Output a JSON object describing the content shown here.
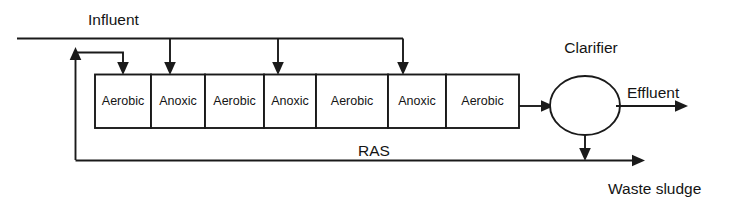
{
  "diagram": {
    "line_color": "#1a1a1a",
    "text_color": "#141414",
    "background_color": "#ffffff",
    "labels": {
      "influent": "Influent",
      "clarifier": "Clarifier",
      "effluent": "Effluent",
      "ras": "RAS",
      "waste_sludge": "Waste sludge"
    },
    "reactor_cells": [
      {
        "label": "Aerobic"
      },
      {
        "label": "Anoxic"
      },
      {
        "label": "Aerobic"
      },
      {
        "label": "Anoxic"
      },
      {
        "label": "Aerobic"
      },
      {
        "label": "Anoxic"
      },
      {
        "label": "Aerobic"
      }
    ],
    "influent_feed_points": 3,
    "recycle_stream": "RAS",
    "waste_stream": "Waste sludge"
  }
}
